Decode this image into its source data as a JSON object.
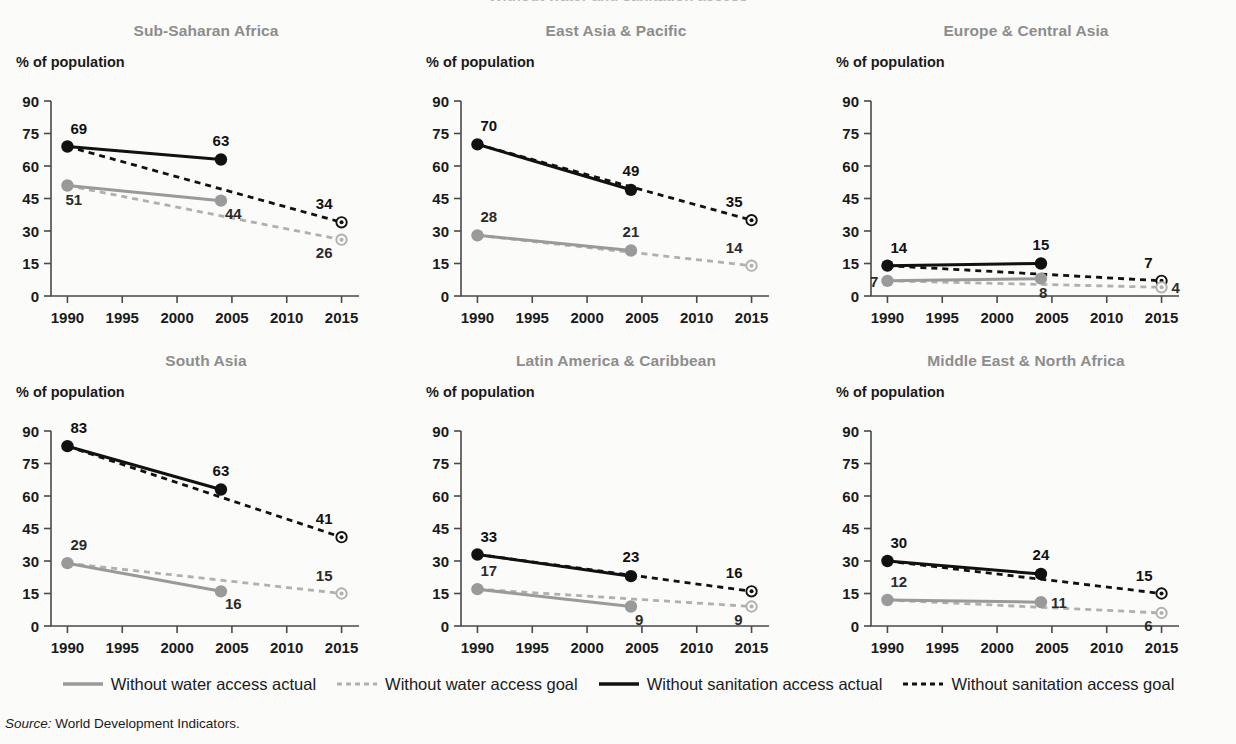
{
  "figure": {
    "clipped_top_text": "Without water and sanitation access",
    "y_axis_label": "% of population",
    "source_prefix": "Source:",
    "source_text": "World Development Indicators."
  },
  "colors": {
    "actual_sanitation": "#111111",
    "goal_sanitation": "#111111",
    "actual_water": "#9a9a9a",
    "goal_water": "#b0b0b0",
    "title": "#8d8d8d",
    "axis": "#4a4a4a",
    "background": "#fbfbfa"
  },
  "legend": {
    "position": "bottom-center",
    "items": [
      {
        "label": "Without water access actual",
        "style": "solid",
        "color": "#9a9a9a",
        "icon": "line-solid-grey-icon"
      },
      {
        "label": "Without water access goal",
        "style": "dashed",
        "color": "#b0b0b0",
        "icon": "line-dashed-grey-icon"
      },
      {
        "label": "Without sanitation access actual",
        "style": "solid",
        "color": "#111111",
        "icon": "line-solid-black-icon"
      },
      {
        "label": "Without sanitation access goal",
        "style": "dashed",
        "color": "#111111",
        "icon": "line-dashed-black-icon"
      }
    ]
  },
  "chart_data": {
    "type": "line",
    "title": "Without water and sanitation access",
    "ylabel": "% of population",
    "xlabel": "",
    "ylim": [
      0,
      90
    ],
    "yticks": [
      0,
      15,
      30,
      45,
      60,
      75,
      90
    ],
    "xlim": [
      1988.5,
      2016.5
    ],
    "xticks": [
      1990,
      1995,
      2000,
      2005,
      2010,
      2015
    ],
    "xtick_labels": [
      "1990",
      "1995",
      "2000",
      "2005",
      "2010",
      "2015"
    ],
    "grid": false,
    "legend_position": "bottom",
    "panels": [
      {
        "title": "Sub-Saharan Africa",
        "series": [
          {
            "name": "Without sanitation access actual",
            "style": "solid",
            "color": "#111111",
            "x": [
              1990,
              2004
            ],
            "values": [
              69,
              63
            ],
            "labels": [
              {
                "text": "69",
                "pos": "above-right"
              },
              {
                "text": "63",
                "pos": "above"
              }
            ]
          },
          {
            "name": "Without sanitation access goal",
            "style": "dashed",
            "color": "#111111",
            "x": [
              1990,
              2015
            ],
            "values": [
              69,
              34
            ],
            "labels": [
              {
                "text": "34",
                "pos": "above-left"
              }
            ]
          },
          {
            "name": "Without water access actual",
            "style": "solid",
            "color": "#9a9a9a",
            "x": [
              1990,
              2004
            ],
            "values": [
              51,
              44
            ],
            "labels": [
              {
                "text": "51",
                "pos": "below-right"
              },
              {
                "text": "44",
                "pos": "below"
              }
            ]
          },
          {
            "name": "Without water access goal",
            "style": "dashed",
            "color": "#b0b0b0",
            "x": [
              1990,
              2015
            ],
            "values": [
              51,
              26
            ],
            "labels": [
              {
                "text": "26",
                "pos": "below-left"
              }
            ]
          }
        ]
      },
      {
        "title": "East Asia & Pacific",
        "series": [
          {
            "name": "Without sanitation access actual",
            "style": "solid",
            "color": "#111111",
            "x": [
              1990,
              2004
            ],
            "values": [
              70,
              49
            ],
            "labels": [
              {
                "text": "70",
                "pos": "above-right"
              },
              {
                "text": "49",
                "pos": "above"
              }
            ]
          },
          {
            "name": "Without sanitation access goal",
            "style": "dashed",
            "color": "#111111",
            "x": [
              1990,
              2015
            ],
            "values": [
              70,
              35
            ],
            "labels": [
              {
                "text": "35",
                "pos": "above-left"
              }
            ]
          },
          {
            "name": "Without water access actual",
            "style": "solid",
            "color": "#9a9a9a",
            "x": [
              1990,
              2004
            ],
            "values": [
              28,
              21
            ],
            "labels": [
              {
                "text": "28",
                "pos": "above-right"
              },
              {
                "text": "21",
                "pos": "above"
              }
            ]
          },
          {
            "name": "Without water access goal",
            "style": "dashed",
            "color": "#b0b0b0",
            "x": [
              1990,
              2015
            ],
            "values": [
              28,
              14
            ],
            "labels": [
              {
                "text": "14",
                "pos": "above-left"
              }
            ]
          }
        ]
      },
      {
        "title": "Europe & Central Asia",
        "series": [
          {
            "name": "Without sanitation access actual",
            "style": "solid",
            "color": "#111111",
            "x": [
              1990,
              2004
            ],
            "values": [
              14,
              15
            ],
            "labels": [
              {
                "text": "14",
                "pos": "above-right"
              },
              {
                "text": "15",
                "pos": "above"
              }
            ]
          },
          {
            "name": "Without sanitation access goal",
            "style": "dashed",
            "color": "#111111",
            "x": [
              1990,
              2015
            ],
            "values": [
              14,
              7
            ],
            "labels": [
              {
                "text": "7",
                "pos": "above-left"
              }
            ]
          },
          {
            "name": "Without water access actual",
            "style": "solid",
            "color": "#9a9a9a",
            "x": [
              1990,
              2004
            ],
            "values": [
              7,
              8
            ],
            "labels": [
              {
                "text": "7",
                "pos": "left"
              },
              {
                "text": "8",
                "pos": "below-right"
              }
            ]
          },
          {
            "name": "Without water access goal",
            "style": "dashed",
            "color": "#b0b0b0",
            "x": [
              1990,
              2015
            ],
            "values": [
              7,
              4
            ],
            "labels": [
              {
                "text": "4",
                "pos": "right"
              }
            ]
          }
        ]
      },
      {
        "title": "South Asia",
        "series": [
          {
            "name": "Without sanitation access actual",
            "style": "solid",
            "color": "#111111",
            "x": [
              1990,
              2004
            ],
            "values": [
              83,
              63
            ],
            "labels": [
              {
                "text": "83",
                "pos": "above-right"
              },
              {
                "text": "63",
                "pos": "above"
              }
            ]
          },
          {
            "name": "Without sanitation access goal",
            "style": "dashed",
            "color": "#111111",
            "x": [
              1990,
              2015
            ],
            "values": [
              83,
              41
            ],
            "labels": [
              {
                "text": "41",
                "pos": "above-left"
              }
            ]
          },
          {
            "name": "Without water access actual",
            "style": "solid",
            "color": "#9a9a9a",
            "x": [
              1990,
              2004
            ],
            "values": [
              29,
              16
            ],
            "labels": [
              {
                "text": "29",
                "pos": "above-right"
              },
              {
                "text": "16",
                "pos": "below"
              }
            ]
          },
          {
            "name": "Without water access goal",
            "style": "dashed",
            "color": "#b0b0b0",
            "x": [
              1990,
              2015
            ],
            "values": [
              29,
              15
            ],
            "labels": [
              {
                "text": "15",
                "pos": "above-left"
              }
            ]
          }
        ]
      },
      {
        "title": "Latin America & Caribbean",
        "series": [
          {
            "name": "Without sanitation access actual",
            "style": "solid",
            "color": "#111111",
            "x": [
              1990,
              2004
            ],
            "values": [
              33,
              23
            ],
            "labels": [
              {
                "text": "33",
                "pos": "above-right"
              },
              {
                "text": "23",
                "pos": "above"
              }
            ]
          },
          {
            "name": "Without sanitation access goal",
            "style": "dashed",
            "color": "#111111",
            "x": [
              1990,
              2015
            ],
            "values": [
              33,
              16
            ],
            "labels": [
              {
                "text": "16",
                "pos": "above-left"
              }
            ]
          },
          {
            "name": "Without water access actual",
            "style": "solid",
            "color": "#9a9a9a",
            "x": [
              1990,
              2004
            ],
            "values": [
              17,
              9
            ],
            "labels": [
              {
                "text": "17",
                "pos": "above-right"
              },
              {
                "text": "9",
                "pos": "below"
              }
            ]
          },
          {
            "name": "Without water access goal",
            "style": "dashed",
            "color": "#b0b0b0",
            "x": [
              1990,
              2015
            ],
            "values": [
              17,
              9
            ],
            "labels": [
              {
                "text": "9",
                "pos": "below-left"
              }
            ]
          }
        ]
      },
      {
        "title": "Middle East & North Africa",
        "series": [
          {
            "name": "Without sanitation access actual",
            "style": "solid",
            "color": "#111111",
            "x": [
              1990,
              2004
            ],
            "values": [
              30,
              24
            ],
            "labels": [
              {
                "text": "30",
                "pos": "above-right"
              },
              {
                "text": "24",
                "pos": "above"
              }
            ]
          },
          {
            "name": "Without sanitation access goal",
            "style": "dashed",
            "color": "#111111",
            "x": [
              1990,
              2015
            ],
            "values": [
              30,
              15
            ],
            "labels": [
              {
                "text": "15",
                "pos": "above-left"
              }
            ]
          },
          {
            "name": "Without water access actual",
            "style": "solid",
            "color": "#9a9a9a",
            "x": [
              1990,
              2004
            ],
            "values": [
              12,
              11
            ],
            "labels": [
              {
                "text": "12",
                "pos": "above-right"
              },
              {
                "text": "11",
                "pos": "right"
              }
            ]
          },
          {
            "name": "Without water access goal",
            "style": "dashed",
            "color": "#b0b0b0",
            "x": [
              1990,
              2015
            ],
            "values": [
              12,
              6
            ],
            "labels": [
              {
                "text": "6",
                "pos": "below-left"
              }
            ]
          }
        ]
      }
    ]
  }
}
